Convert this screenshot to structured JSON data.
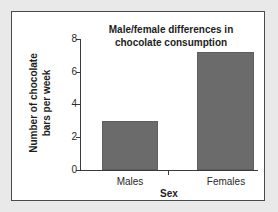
{
  "chart_data": {
    "type": "bar",
    "title": "Male/female differences in chocolate consumption",
    "title_line1": "Male/female differences in",
    "title_line2": "chocolate consumption",
    "xlabel": "Sex",
    "ylabel": "Number of chocolate bars per week",
    "ylabel_line1": "Number of chocolate",
    "ylabel_line2": "bars per week",
    "categories": [
      "Males",
      "Females"
    ],
    "values": [
      3.0,
      7.2
    ],
    "ylim": [
      0,
      8
    ],
    "yticks": [
      0,
      2,
      4,
      6,
      8
    ],
    "ytick_labels": [
      "0",
      "2",
      "4",
      "6",
      "8"
    ],
    "grid": false,
    "legend": false,
    "bar_color": "#6b6b6b",
    "axis_color": "#3a3a3a",
    "background": "#ffffff",
    "page_background": "#e9e9e9",
    "frame_color": "#4a4a4a"
  }
}
